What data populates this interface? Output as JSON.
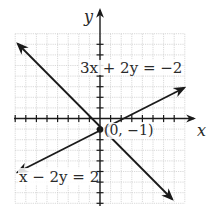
{
  "figure": {
    "type": "coordinate-plane",
    "axes": {
      "x_label": "x",
      "y_label": "y",
      "x_range": [
        -8,
        8
      ],
      "y_range": [
        -8,
        8
      ],
      "tick_spacing": 1,
      "grid": true
    },
    "lines": [
      {
        "equation": "3x + 2y = −2",
        "label": "3x + 2y = −2",
        "endpoints_px": [
          [
            18,
            44
          ],
          [
            172,
            199
          ]
        ],
        "arrows": "both"
      },
      {
        "equation": "x − 2y = 2",
        "label": "x − 2y = 2",
        "endpoints_px": [
          [
            18,
            172
          ],
          [
            184,
            88
          ]
        ],
        "arrows": "both"
      }
    ],
    "intersection": {
      "label": "(0, −1)",
      "x": 0,
      "y": -1
    }
  },
  "colors": {
    "grid": "#c8c8c8",
    "axis": "#1a1a1a",
    "line": "#1a1a1a",
    "background": "#ffffff"
  }
}
